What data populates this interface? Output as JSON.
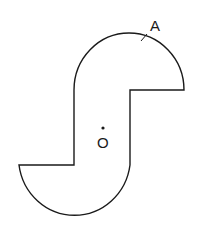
{
  "diagram": {
    "type": "geometry-figure",
    "labels": {
      "point_A": "A",
      "point_O": "O"
    },
    "colors": {
      "stroke": "#1a1a1a",
      "background": "#ffffff"
    }
  }
}
